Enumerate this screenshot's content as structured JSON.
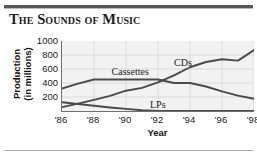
{
  "title": "The Sounds of Music",
  "axis": {
    "ylabel_line1": "Production",
    "ylabel_line2": "(in millions)",
    "xlabel": "Year",
    "yticks": [
      "1000",
      "800",
      "600",
      "400",
      "200"
    ],
    "xticks": [
      "'86",
      "'88",
      "'90",
      "'92",
      "'94",
      "'96",
      "'98"
    ]
  },
  "labels": {
    "cds": "CDs",
    "cassettes": "Cassettes",
    "lps": "LPs"
  },
  "colors": {
    "line": "#4a4a4c",
    "plot_bg": "#f2f2f2",
    "grid": "#d8d8d8",
    "axis": "#6f6f71",
    "rule": "#58585a",
    "text": "#19191b"
  },
  "chart_data": {
    "type": "line",
    "title": "The Sounds of Music",
    "xlabel": "Year",
    "ylabel": "Production (in millions)",
    "xlim": [
      1986,
      1998
    ],
    "ylim": [
      0,
      1000
    ],
    "ytick_values": [
      200,
      400,
      600,
      800,
      1000
    ],
    "xtick_values": [
      1986,
      1988,
      1990,
      1992,
      1994,
      1996,
      1998
    ],
    "xtick_labels": [
      "'86",
      "'88",
      "'90",
      "'92",
      "'94",
      "'96",
      "'98"
    ],
    "grid": true,
    "legend": "inline-labels",
    "x": [
      1986,
      1987,
      1988,
      1989,
      1990,
      1991,
      1992,
      1993,
      1994,
      1995,
      1996,
      1997,
      1998
    ],
    "series": [
      {
        "name": "Cassettes",
        "values": [
          320,
          390,
          450,
          450,
          450,
          450,
          450,
          400,
          400,
          350,
          280,
          220,
          175
        ],
        "label_x": 1989.1,
        "label_y": 560
      },
      {
        "name": "CDs",
        "values": [
          55,
          105,
          160,
          215,
          290,
          330,
          410,
          510,
          625,
          700,
          740,
          720,
          870
        ],
        "label_x": 1993.0,
        "label_y": 690
      },
      {
        "name": "LPs",
        "values": [
          125,
          100,
          75,
          50,
          30,
          10,
          0,
          0,
          0,
          0,
          0,
          0,
          0
        ],
        "label_x": 1991.5,
        "label_y": 85
      }
    ],
    "annotations": [
      {
        "text": "Cassettes",
        "note": "inline series label above cassette plateau"
      },
      {
        "text": "CDs",
        "note": "inline series label above rising CD curve"
      },
      {
        "text": "LPs",
        "note": "inline series label near zero baseline"
      }
    ]
  }
}
